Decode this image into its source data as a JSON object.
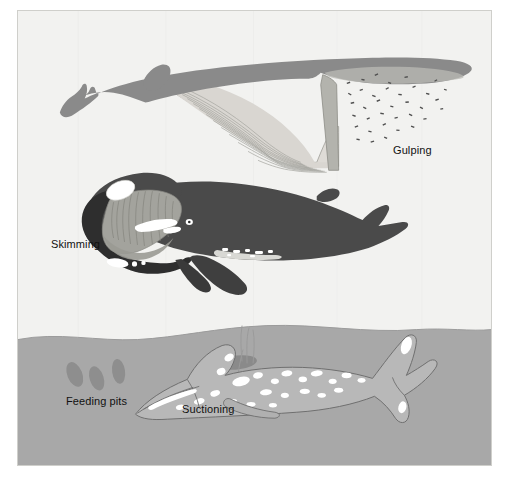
{
  "figure": {
    "type": "diagram",
    "background_color": "#ffffff",
    "frame_color": "#f2f2f0",
    "frame_border_color": "#cfcfcb"
  },
  "scene": {
    "water_color": "#f2f2f0",
    "seafloor_color": "#a8a8a8",
    "seafloor_top_y": 335,
    "outline_color": "#6b6b6b"
  },
  "labels": {
    "gulping": "Gulping",
    "skimming": "Skimming",
    "feeding_pits": "Feeding pits",
    "suctioning": "Suctioning"
  },
  "whales": [
    {
      "id": "gulping-whale",
      "common_name": "Rorqual",
      "feeding_method": "Gulping",
      "body_color": "#8a8a8a",
      "pouch_color": "#d8d8d4",
      "pleat_color": "#9a9a96",
      "position": "top",
      "facing": "right",
      "prey": "krill swarm",
      "prey_color": "#4f4f4f"
    },
    {
      "id": "skimming-whale",
      "common_name": "Right whale",
      "feeding_method": "Skimming",
      "body_color": "#4a4a4a",
      "baleen_color": "#a3a39d",
      "callosity_color": "#ffffff",
      "position": "middle",
      "facing": "left",
      "prey": "copepod swarm",
      "prey_color": "#4f4f4f"
    },
    {
      "id": "suctioning-whale",
      "common_name": "Gray whale",
      "feeding_method": "Suctioning",
      "body_color": "#b8b8b8",
      "mottling_color": "#ffffff",
      "position": "bottom-seafloor",
      "facing": "left",
      "prey": "benthic amphipods"
    }
  ],
  "seafloor_features": {
    "feeding_pits_label": "Feeding pits",
    "pit_color": "#8e8e8e",
    "legend_pit_count": 3,
    "active_pit_count": 2,
    "sediment_plume_color": "#9a9a9a",
    "plume_streak_count": 4
  }
}
